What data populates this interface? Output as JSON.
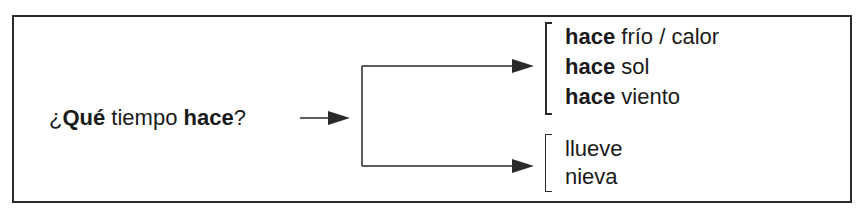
{
  "diagram": {
    "question": {
      "prefix": "¿",
      "bold1": "Qué",
      "middle": " tiempo ",
      "bold2": "hace",
      "suffix": "?"
    },
    "branches": [
      {
        "items": [
          {
            "bold": "hace",
            "rest": " frío / calor"
          },
          {
            "bold": "hace",
            "rest": " sol"
          },
          {
            "bold": "hace",
            "rest": " viento"
          }
        ]
      },
      {
        "items": [
          {
            "bold": "",
            "rest": "llueve"
          },
          {
            "bold": "",
            "rest": "nieva"
          }
        ]
      }
    ],
    "colors": {
      "line": "#2a2a2a",
      "text": "#1a1a1a",
      "background": "#ffffff"
    }
  }
}
